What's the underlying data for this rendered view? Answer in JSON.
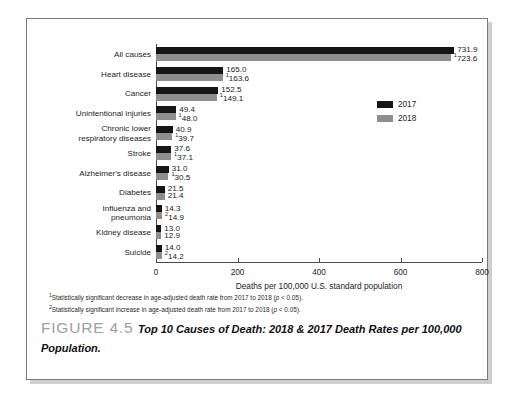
{
  "figure": {
    "number_label": "FIGURE 4.5",
    "caption": "Top 10 Causes of Death: 2018 & 2017 Death Rates per 100,000 Population."
  },
  "legend": {
    "position": "right-upper",
    "items": [
      {
        "label": "2017",
        "color": "#161616"
      },
      {
        "label": "2018",
        "color": "#8e8e8e"
      }
    ]
  },
  "footnotes": [
    {
      "marker": "1",
      "text": "Statistically significant decrease in age-adjusted death rate from 2017 to 2018 (",
      "italic": "p",
      "tail": " < 0.05)."
    },
    {
      "marker": "2",
      "text": "Statistically significant increase in age-adjusted death rate from 2017 to 2018 (",
      "italic": "p",
      "tail": " < 0.05)."
    }
  ],
  "chart_data": {
    "type": "bar",
    "orientation": "horizontal",
    "title": "",
    "xlabel": "Deaths per 100,000 U.S. standard population",
    "ylabel": "",
    "xlim": [
      0,
      800
    ],
    "xticks": [
      0,
      200,
      400,
      600,
      800
    ],
    "xtick_labels": [
      "0",
      "200",
      "400",
      "600",
      "800"
    ],
    "grid": false,
    "legend_position": "right-upper",
    "categories": [
      "All causes",
      "Heart disease",
      "Cancer",
      "Unintentional injuries",
      "Chronic lower\nrespiratory diseases",
      "Stroke",
      "Alzheimer's disease",
      "Diabetes",
      "Influenza and\npneumonia",
      "Kidney disease",
      "Suicide"
    ],
    "series": [
      {
        "name": "2017",
        "color": "#161616",
        "values": [
          731.9,
          165.0,
          152.5,
          49.4,
          40.9,
          37.6,
          31.0,
          21.5,
          14.3,
          13.0,
          14.0
        ],
        "value_labels": [
          "731.9",
          "165.0",
          "152.5",
          "49.4",
          "40.9",
          "37.6",
          "31.0",
          "21.5",
          "14.3",
          "13.0",
          "14.0"
        ],
        "value_markers": [
          "",
          "",
          "",
          "",
          "",
          "",
          "",
          "",
          "",
          "",
          ""
        ]
      },
      {
        "name": "2018",
        "color": "#8e8e8e",
        "values": [
          723.6,
          163.6,
          149.1,
          48.0,
          39.7,
          37.1,
          30.5,
          21.4,
          14.9,
          12.9,
          14.2
        ],
        "value_labels": [
          "723.6",
          "163.6",
          "149.1",
          "48.0",
          "39.7",
          "37.1",
          "30.5",
          "21.4",
          "14.9",
          "12.9",
          "14.2"
        ],
        "value_markers": [
          "1",
          "1",
          "1",
          "1",
          "1",
          "1",
          "1",
          "",
          "2",
          "",
          "2"
        ]
      }
    ]
  }
}
